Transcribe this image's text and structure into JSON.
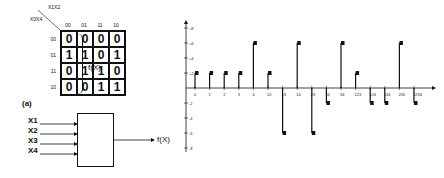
{
  "figure_label": "(a)",
  "kmap": {
    "row_var_label": "X3X4",
    "col_var_label": "X1X2",
    "col_headers": [
      "00",
      "01",
      "11",
      "10"
    ],
    "row_headers": [
      "00",
      "01",
      "11",
      "10"
    ],
    "cells": [
      [
        "0",
        "0",
        "0",
        "0"
      ],
      [
        "1",
        "1",
        "0",
        "1"
      ],
      [
        "0",
        "1",
        "1",
        "0"
      ],
      [
        "0",
        "0",
        "1",
        "1"
      ]
    ],
    "output_label": "f(X)"
  },
  "block": {
    "inputs": [
      "X1",
      "X2",
      "X3",
      "X4"
    ],
    "output_label": "f(X)"
  },
  "chart_data": {
    "type": "bar",
    "title": "",
    "xlabel": "",
    "ylabel": "",
    "categories": [
      "0",
      "1",
      "2",
      "3",
      "4",
      "12",
      "13",
      "14",
      "23",
      "24",
      "34",
      "123",
      "124",
      "134",
      "234",
      "1234"
    ],
    "values": [
      2,
      2,
      2,
      2,
      6,
      2,
      -6,
      6,
      -6,
      -2,
      6,
      2,
      -2,
      -2,
      6,
      -2
    ],
    "yticks": [
      "+8",
      "+6",
      "+4",
      "+2",
      "-2",
      "-4",
      "-6",
      "-8"
    ],
    "ylim": [
      -8,
      8
    ],
    "grid": false,
    "legend": null
  }
}
